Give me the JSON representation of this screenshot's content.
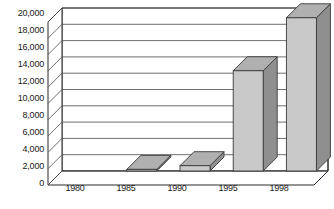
{
  "chart_data": {
    "type": "bar",
    "style": "3d-column",
    "title": "",
    "subtitle": "",
    "xlabel": "",
    "ylabel": "",
    "categories": [
      "1980",
      "1985",
      "1990",
      "1995",
      "1998"
    ],
    "values": [
      0,
      200,
      650,
      12300,
      18800
    ],
    "series": [
      {
        "name": "",
        "values": [
          0,
          200,
          650,
          12300,
          18800
        ]
      }
    ],
    "ylim": [
      0,
      20000
    ],
    "y_tick_step": 2000,
    "y_tick_labels": [
      "20,000",
      "18,000",
      "16,000",
      "14,000",
      "12,000",
      "10,000",
      "8,000",
      "6,000",
      "4,000",
      "2,000",
      "0"
    ],
    "y_tick_values": [
      20000,
      18000,
      16000,
      14000,
      12000,
      10000,
      8000,
      6000,
      4000,
      2000,
      0
    ],
    "grid": true,
    "grid_axis": "y",
    "legend": false,
    "legend_position": "none",
    "annotations": [],
    "colors": {
      "bar_front": "#c9c9c9",
      "bar_side": "#8f8f8f",
      "bar_top": "#b0b0b0",
      "bar_outline": "#3a3a3a",
      "grid_line": "#4a4a4a",
      "frame": "#2b2b2b",
      "wall_back": "#ffffff",
      "wall_side": "#ffffff",
      "floor": "#ffffff",
      "text": "#1a1a1a",
      "background": "#ffffff"
    }
  }
}
